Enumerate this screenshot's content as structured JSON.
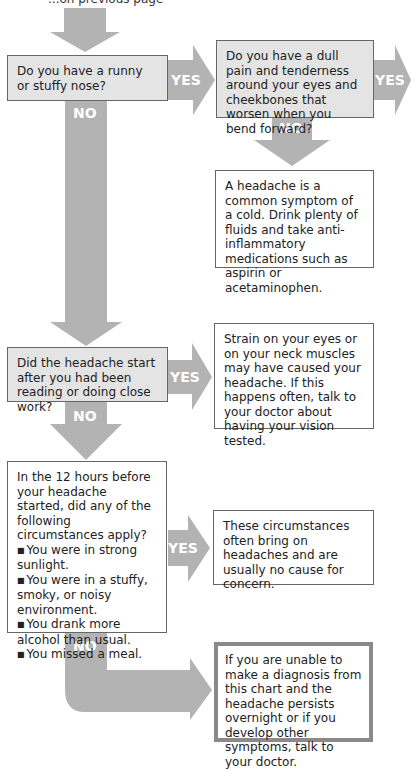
{
  "header": {
    "partial_text": "...on previous page"
  },
  "nodes": {
    "q1": "Do you have a runny or stuffy nose?",
    "q2": "Do you have a dull pain and tenderness around your eyes and cheekbones that worsen when you bend forward?",
    "r_cold": "A headache is a common symptom of a cold. Drink plenty of fluids and take anti-inflammatory medications such as aspirin or acetaminophen.",
    "q3": "Did the headache start after you had been reading or doing close work?",
    "r_strain": "Strain on your eyes or on your neck muscles may have caused your headache. If this happens often, talk to your doctor about having your vision tested.",
    "q4": "In the 12 hours before your headache started, did any of the following circumstances apply?",
    "q4_items": [
      "You were in strong sunlight.",
      "You were in a stuffy, smoky, or noisy environment.",
      "You drank more alcohol than usual.",
      "You missed a meal."
    ],
    "r_circ": "These circumstances often bring on headaches and are usually no cause for concern.",
    "r_final": "If you are unable to make a diagnosis from this chart and the headache persists overnight or if you develop other symptoms, talk to your doctor."
  },
  "labels": {
    "yes": "YES",
    "no": "NO"
  },
  "colors": {
    "arrow": "#b3b3b3",
    "question_bg": "#e4e4e4",
    "border": "#666666"
  }
}
